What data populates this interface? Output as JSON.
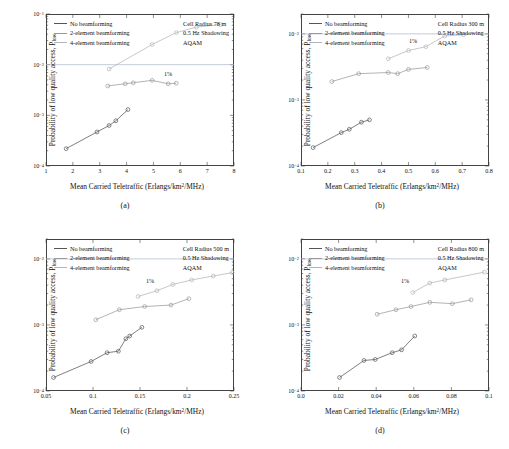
{
  "figure": {
    "ylabel_text": "Probability of low quality access, P",
    "ylabel_sub": "low",
    "xlabel_main": "Mean Carried Teletraffic (Erlangs/km",
    "xlabel_sup": "2",
    "xlabel_tail": "/MHz)",
    "pct_annotation": "1%",
    "legend": [
      {
        "label": "No beamforming",
        "color": "#555555"
      },
      {
        "label": "2-element beamforming",
        "color": "#999999"
      },
      {
        "label": "4-element beamforming",
        "color": "#b5b5b5"
      }
    ],
    "shadowing_note": "0.5 Hz Shadowing",
    "scheme_note": "AQAM"
  },
  "chart_data": [
    {
      "type": "scatter",
      "panel": "a",
      "caption": "(a)",
      "title": "",
      "cell_radius_note": "Cell Radius 78 m",
      "xlabel": "Mean Carried Teletraffic (Erlangs/km2/MHz)",
      "ylabel": "Probability of low quality access, Plow",
      "xlim": [
        1,
        8
      ],
      "ylim": [
        0.0001,
        0.1
      ],
      "yscale": "log",
      "xticks": [
        "1",
        "2",
        "3",
        "4",
        "5",
        "6",
        "7",
        "8"
      ],
      "yticks": [
        "10-4",
        "10-3",
        "10-2",
        "10-1"
      ],
      "grid": false,
      "legend_position": "top-left",
      "series": [
        {
          "name": "No beamforming",
          "color": "#555555",
          "points": [
            [
              1.75,
              0.00022
            ],
            [
              2.9,
              0.00047
            ],
            [
              3.35,
              0.00063
            ],
            [
              3.6,
              0.00078
            ],
            [
              4.05,
              0.0013
            ]
          ]
        },
        {
          "name": "2-element beamforming",
          "color": "#999999",
          "points": [
            [
              3.3,
              0.0038
            ],
            [
              3.95,
              0.0042
            ],
            [
              4.25,
              0.0044
            ],
            [
              4.95,
              0.0049
            ],
            [
              5.55,
              0.0042
            ],
            [
              5.85,
              0.0043
            ]
          ]
        },
        {
          "name": "4-element beamforming",
          "color": "#b5b5b5",
          "points": [
            [
              3.35,
              0.0082
            ],
            [
              4.95,
              0.025
            ],
            [
              5.85,
              0.043
            ],
            [
              6.6,
              0.055
            ],
            [
              7.5,
              0.062
            ]
          ]
        }
      ]
    },
    {
      "type": "scatter",
      "panel": "b",
      "caption": "(b)",
      "title": "",
      "cell_radius_note": "Cell Radius 300 m",
      "xlabel": "Mean Carried Teletraffic (Erlangs/km2/MHz)",
      "ylabel": "Probability of low quality access, Plow",
      "xlim": [
        0.1,
        0.8
      ],
      "ylim": [
        0.0001,
        0.02
      ],
      "yscale": "log",
      "xticks": [
        "0.1",
        "0.2",
        "0.3",
        "0.4",
        "0.5",
        "0.6",
        "0.7",
        "0.8"
      ],
      "yticks": [
        "10-4",
        "10-3",
        "10-2"
      ],
      "grid": false,
      "legend_position": "top-left",
      "series": [
        {
          "name": "No beamforming",
          "color": "#555555",
          "points": [
            [
              0.145,
              0.00019
            ],
            [
              0.25,
              0.00032
            ],
            [
              0.28,
              0.00036
            ],
            [
              0.325,
              0.00046
            ],
            [
              0.355,
              0.0005
            ]
          ]
        },
        {
          "name": "2-element beamforming",
          "color": "#999999",
          "points": [
            [
              0.215,
              0.0019
            ],
            [
              0.315,
              0.0025
            ],
            [
              0.425,
              0.0026
            ],
            [
              0.46,
              0.0025
            ],
            [
              0.5,
              0.0029
            ],
            [
              0.57,
              0.0031
            ]
          ]
        },
        {
          "name": "4-element beamforming",
          "color": "#b5b5b5",
          "points": [
            [
              0.425,
              0.0042
            ],
            [
              0.5,
              0.0056
            ],
            [
              0.565,
              0.0064
            ],
            [
              0.635,
              0.0093
            ],
            [
              0.705,
              0.0097
            ]
          ]
        }
      ]
    },
    {
      "type": "scatter",
      "panel": "c",
      "caption": "(c)",
      "title": "",
      "cell_radius_note": "Cell Radius 500 m",
      "xlabel": "Mean Carried Teletraffic (Erlangs/km2/MHz)",
      "ylabel": "Probability of low quality access, Plow",
      "xlim": [
        0.05,
        0.25
      ],
      "ylim": [
        0.0001,
        0.02
      ],
      "yscale": "log",
      "xticks": [
        "0.05",
        "0.1",
        "0.15",
        "0.2",
        "0.25"
      ],
      "yticks": [
        "10-4",
        "10-3",
        "10-2"
      ],
      "grid": false,
      "legend_position": "top-left",
      "series": [
        {
          "name": "No beamforming",
          "color": "#555555",
          "points": [
            [
              0.058,
              0.00016
            ],
            [
              0.098,
              0.00028
            ],
            [
              0.115,
              0.00038
            ],
            [
              0.127,
              0.0004
            ],
            [
              0.135,
              0.00062
            ],
            [
              0.139,
              0.00068
            ],
            [
              0.152,
              0.00092
            ]
          ]
        },
        {
          "name": "2-element beamforming",
          "color": "#999999",
          "points": [
            [
              0.103,
              0.0012
            ],
            [
              0.128,
              0.0017
            ],
            [
              0.155,
              0.0019
            ],
            [
              0.183,
              0.002
            ],
            [
              0.202,
              0.0025
            ]
          ]
        },
        {
          "name": "4-element beamforming",
          "color": "#b5b5b5",
          "points": [
            [
              0.148,
              0.0027
            ],
            [
              0.168,
              0.0033
            ],
            [
              0.185,
              0.0041
            ],
            [
              0.205,
              0.0048
            ],
            [
              0.228,
              0.0055
            ],
            [
              0.248,
              0.0062
            ]
          ]
        }
      ]
    },
    {
      "type": "scatter",
      "panel": "d",
      "caption": "(d)",
      "title": "",
      "cell_radius_note": "Cell Radius 800 m",
      "xlabel": "Mean Carried Teletraffic (Erlangs/km2/MHz)",
      "ylabel": "Probability of low quality access, Plow",
      "xlim": [
        0,
        0.1
      ],
      "ylim": [
        0.0001,
        0.02
      ],
      "yscale": "log",
      "xticks": [
        "0.0",
        "0.02",
        "0.04",
        "0.06",
        "0.08",
        "0.1"
      ],
      "yticks": [
        "10-4",
        "10-3",
        "10-2"
      ],
      "grid": false,
      "legend_position": "top-left",
      "series": [
        {
          "name": "No beamforming",
          "color": "#555555",
          "points": [
            [
              0.0205,
              0.00016
            ],
            [
              0.0335,
              0.00029
            ],
            [
              0.0395,
              0.0003
            ],
            [
              0.0485,
              0.00038
            ],
            [
              0.0535,
              0.00042
            ],
            [
              0.0605,
              0.00068
            ]
          ]
        },
        {
          "name": "2-element beamforming",
          "color": "#999999",
          "points": [
            [
              0.0405,
              0.00145
            ],
            [
              0.0505,
              0.0017
            ],
            [
              0.0585,
              0.0019
            ],
            [
              0.0685,
              0.0022
            ],
            [
              0.0805,
              0.0021
            ],
            [
              0.0905,
              0.0024
            ]
          ]
        },
        {
          "name": "4-element beamforming",
          "color": "#b5b5b5",
          "points": [
            [
              0.0595,
              0.0031
            ],
            [
              0.0685,
              0.0043
            ],
            [
              0.0765,
              0.0048
            ],
            [
              0.0975,
              0.0063
            ]
          ]
        }
      ]
    }
  ]
}
